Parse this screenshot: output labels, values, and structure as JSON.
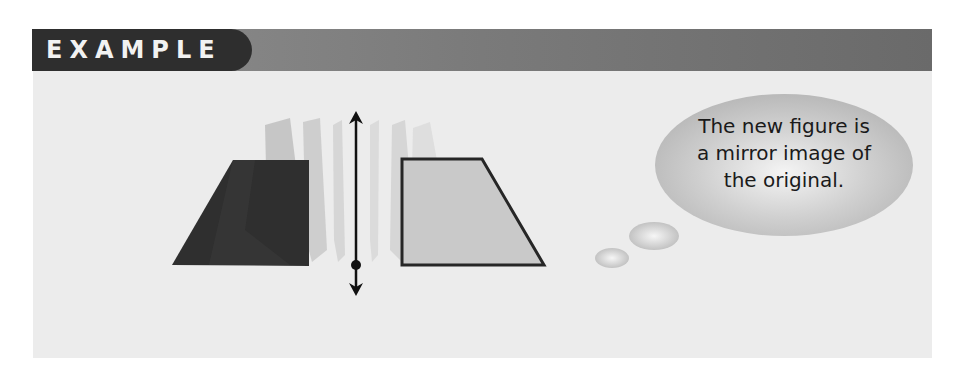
{
  "header": {
    "label": "EXAMPLE",
    "tab_color": "#2e2e2e",
    "bar_color": "#7a7a7a"
  },
  "figure": {
    "original_shape": {
      "fill": "#2f2f2f",
      "points": [
        [
          172,
          265
        ],
        [
          233,
          160
        ],
        [
          309,
          160
        ],
        [
          309,
          266
        ]
      ]
    },
    "reflected_shape": {
      "fill": "#c8c8c8",
      "stroke": "#2a2a2a",
      "points": [
        [
          402,
          159
        ],
        [
          482,
          159
        ],
        [
          544,
          265
        ],
        [
          402,
          265
        ]
      ]
    },
    "line_of_reflection": {
      "x": 356,
      "y_top": 112,
      "y_bottom": 295,
      "point_y": 265
    }
  },
  "thought_bubble": {
    "lines": [
      "The new figure is",
      "a mirror image of",
      "the original."
    ]
  }
}
